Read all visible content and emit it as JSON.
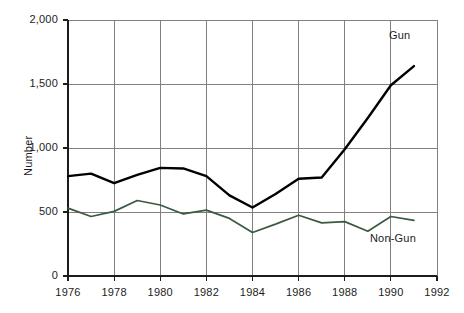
{
  "chart_data": {
    "type": "line",
    "title": "",
    "xlabel": "",
    "ylabel": "Number",
    "x": [
      1976,
      1977,
      1978,
      1979,
      1980,
      1981,
      1982,
      1983,
      1984,
      1985,
      1986,
      1987,
      1988,
      1989,
      1990,
      1991
    ],
    "xlim": [
      1976,
      1992
    ],
    "ylim": [
      0,
      2000
    ],
    "xticks": [
      1976,
      1978,
      1980,
      1982,
      1984,
      1986,
      1988,
      1990,
      1992
    ],
    "xtick_labels": [
      "1976",
      "1978",
      "1980",
      "1982",
      "1984",
      "1986",
      "1988",
      "1990",
      "1992"
    ],
    "yticks": [
      0,
      500,
      1000,
      1500,
      2000
    ],
    "ytick_labels": [
      "0",
      "500",
      "1,000",
      "1,500",
      "2,000"
    ],
    "grid": true,
    "legend_position": "inline-annotation",
    "series": [
      {
        "name": "Gun",
        "color": "#000000",
        "values": [
          780,
          800,
          725,
          790,
          845,
          840,
          780,
          630,
          535,
          640,
          760,
          770,
          990,
          1235,
          1490,
          1640
        ]
      },
      {
        "name": "Non-Gun",
        "color": "#3a5a42",
        "values": [
          530,
          465,
          505,
          590,
          555,
          485,
          515,
          450,
          340,
          405,
          475,
          415,
          425,
          350,
          465,
          435
        ]
      }
    ],
    "annotations": [
      {
        "text": "Gun",
        "series": "Gun"
      },
      {
        "text": "Non-Gun",
        "series": "Non-Gun"
      }
    ]
  },
  "colors": {
    "gun_line": "#000000",
    "nongun_line": "#3a5a42",
    "grid": "#808080",
    "axis": "#1c1c1c",
    "background": "#ffffff"
  }
}
